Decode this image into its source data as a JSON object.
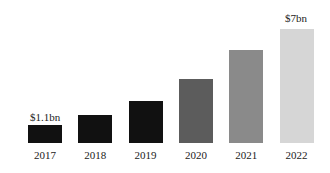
{
  "chart_data": {
    "type": "bar",
    "title": "",
    "xlabel": "",
    "ylabel": "",
    "categories": [
      "2017",
      "2018",
      "2019",
      "2020",
      "2021",
      "2022"
    ],
    "values": [
      1.1,
      1.7,
      2.6,
      3.9,
      5.7,
      7.0
    ],
    "unit": "$bn",
    "data_labels": [
      {
        "category": "2017",
        "text": "$1.1bn"
      },
      {
        "category": "2022",
        "text": "$7bn"
      }
    ],
    "colors": [
      "#111111",
      "#111111",
      "#111111",
      "#5c5c5c",
      "#8a8a8a",
      "#d6d6d6"
    ],
    "grid": false,
    "legend": false,
    "ylim": [
      0,
      7.2
    ]
  },
  "labels": {
    "first": "$1.1bn",
    "last": "$7bn"
  }
}
